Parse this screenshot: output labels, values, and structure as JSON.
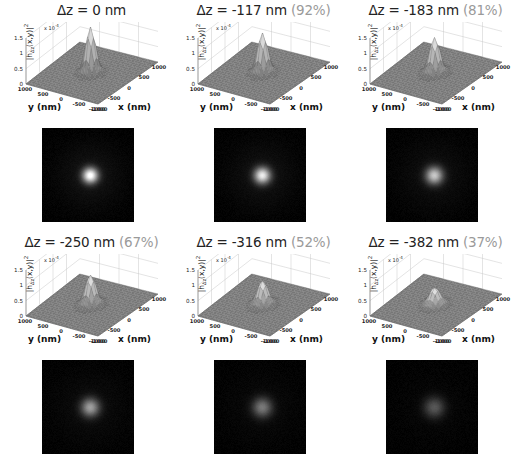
{
  "figure": {
    "kind": "psf-defocus-grid",
    "rows": 2,
    "cols": 3
  },
  "axes": {
    "zlabel_html": "|h<sub>&#916;z</sub>(x,y)|<sup>2</sup>",
    "zlabel_text": "|h_dz(x,y)|^2",
    "z_exponent_html": "x 10<sup>-4</sup>",
    "z_exponent_text": "x 10-4",
    "z_ticks": [
      "0",
      "0.5",
      "1",
      "1.5"
    ],
    "z_tick_values": [
      0,
      0.5,
      1,
      1.5
    ],
    "zlim": [
      0,
      1.5
    ],
    "y_axis_label": "y (nm)",
    "x_axis_label": "x (nm)",
    "y_ticks": [
      "1000",
      "500",
      "0",
      "-500",
      "-1000"
    ],
    "x_ticks": [
      "-1000",
      "-500",
      "0",
      "500",
      "1000"
    ],
    "y_tick_values": [
      1000,
      500,
      0,
      -500,
      -1000
    ],
    "x_tick_values": [
      -1000,
      -500,
      0,
      500,
      1000
    ],
    "xlim": [
      -1000,
      1000
    ],
    "ylim": [
      -1000,
      1000
    ],
    "grid": true
  },
  "colors": {
    "title_text": "#232323",
    "percent_text": "#9a9a9a",
    "grid_line": "#c9c9c9",
    "axis_line": "#6a6a6a",
    "surface_light": "#efefef",
    "surface_mid": "#9d9d9d",
    "surface_dark": "#5c5c5c",
    "base_plane": "#7d7d7d",
    "image_background": "#050505",
    "image_spot": "#ffffff",
    "page_background": "#ffffff"
  },
  "panels": [
    {
      "id": "panel-dz-0",
      "row": 0,
      "col": 0,
      "dz_label": "Δz = 0 nm",
      "dz_nm": 0,
      "percent_label": "",
      "percent": 100,
      "peak_value": 1.5,
      "peak_height_relative": 1.0,
      "spot_brightness": 1.0,
      "spot_radius_px": 8.5
    },
    {
      "id": "panel-dz-117",
      "row": 0,
      "col": 1,
      "dz_label": "Δz = -117 nm",
      "dz_nm": -117,
      "percent_label": "(92%)",
      "percent": 92,
      "peak_value": 1.3,
      "peak_height_relative": 0.87,
      "spot_brightness": 0.88,
      "spot_radius_px": 9.0
    },
    {
      "id": "panel-dz-183",
      "row": 0,
      "col": 2,
      "dz_label": "Δz = -183 nm",
      "dz_nm": -183,
      "percent_label": "(81%)",
      "percent": 81,
      "peak_value": 1.15,
      "peak_height_relative": 0.77,
      "spot_brightness": 0.72,
      "spot_radius_px": 9.5
    },
    {
      "id": "panel-dz-250",
      "row": 1,
      "col": 0,
      "dz_label": "Δz = -250 nm",
      "dz_nm": -250,
      "percent_label": "(67%)",
      "percent": 67,
      "peak_value": 0.98,
      "peak_height_relative": 0.65,
      "spot_brightness": 0.55,
      "spot_radius_px": 10.0
    },
    {
      "id": "panel-dz-316",
      "row": 1,
      "col": 1,
      "dz_label": "Δz = -316 nm",
      "dz_nm": -316,
      "percent_label": "(52%)",
      "percent": 52,
      "peak_value": 0.78,
      "peak_height_relative": 0.52,
      "spot_brightness": 0.4,
      "spot_radius_px": 10.6
    },
    {
      "id": "panel-dz-382",
      "row": 1,
      "col": 2,
      "dz_label": "Δz = -382 nm",
      "dz_nm": -382,
      "percent_label": "(37%)",
      "percent": 37,
      "peak_value": 0.56,
      "peak_height_relative": 0.37,
      "spot_brightness": 0.27,
      "spot_radius_px": 11.2
    }
  ],
  "chart_data": {
    "type": "surface",
    "xlabel": "x (nm)",
    "ylabel": "y (nm)",
    "zlabel": "|h_dz(x,y)|^2",
    "z_scale_exponent": -4,
    "xlim": [
      -1000,
      1000
    ],
    "ylim": [
      -1000,
      1000
    ],
    "zlim": [
      0,
      1.5
    ],
    "xticks": [
      -1000,
      -500,
      0,
      500,
      1000
    ],
    "yticks": [
      1000,
      500,
      0,
      -500,
      -1000
    ],
    "zticks": [
      0,
      0.5,
      1,
      1.5
    ],
    "grid": true,
    "legend": "none",
    "series": [
      {
        "name": "Δz = 0 nm",
        "defocus_nm": 0,
        "peak_intensity": 1.5,
        "strehl_percent": 100
      },
      {
        "name": "Δz = -117 nm",
        "defocus_nm": -117,
        "peak_intensity": 1.3,
        "strehl_percent": 92
      },
      {
        "name": "Δz = -183 nm",
        "defocus_nm": -183,
        "peak_intensity": 1.15,
        "strehl_percent": 81
      },
      {
        "name": "Δz = -250 nm",
        "defocus_nm": -250,
        "peak_intensity": 0.98,
        "strehl_percent": 67
      },
      {
        "name": "Δz = -316 nm",
        "defocus_nm": -316,
        "peak_intensity": 0.78,
        "strehl_percent": 52
      },
      {
        "name": "Δz = -382 nm",
        "defocus_nm": -382,
        "peak_intensity": 0.56,
        "strehl_percent": 37
      }
    ],
    "defocus_nm": [
      0,
      -117,
      -183,
      -250,
      -316,
      -382
    ],
    "peak_intensity": [
      1.5,
      1.3,
      1.15,
      0.98,
      0.78,
      0.56
    ],
    "strehl_percent": [
      100,
      92,
      81,
      67,
      52,
      37
    ]
  }
}
